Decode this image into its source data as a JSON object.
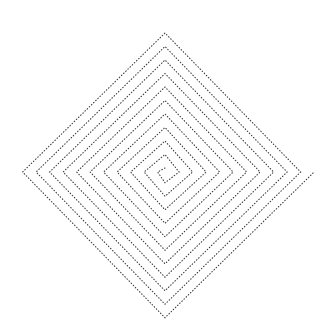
{
  "figure": {
    "background_color": "#ffffff",
    "width": 321,
    "height": 335
  },
  "chart_data": {
    "type": "line",
    "subtitle": "",
    "xlabel": "",
    "ylabel": "",
    "grid": false,
    "legend": null,
    "axes_visible": false,
    "xlim": [
      0,
      321
    ],
    "ylim": [
      0,
      335
    ],
    "series": [
      {
        "name": "spiral",
        "shape": "square-spiral",
        "orientation_deg": 45,
        "direction": "counterclockwise-outward",
        "center": [
          165,
          172
        ],
        "turns": 11,
        "radial_step_px": 13.5,
        "start_radius_px": 4,
        "max_radius_px": 152,
        "stroke_color": "#3c3c3c",
        "stroke_width_px": 1.1,
        "line_style": "dotted",
        "dash_pattern": [
          0.6,
          2.4
        ],
        "vertices_x": [
          165,
          13,
          165,
          313,
          165
        ],
        "vertices_y": [
          11,
          172,
          332,
          172,
          11
        ]
      }
    ],
    "annotations": []
  },
  "colors": {
    "stroke": "#3c3c3c",
    "background": "#ffffff"
  }
}
